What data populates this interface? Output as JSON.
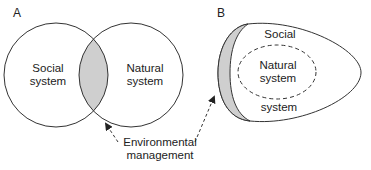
{
  "panels": {
    "a": {
      "letter": "A",
      "left_circle_label_line1": "Social",
      "left_circle_label_line2": "system",
      "right_circle_label_line1": "Natural",
      "right_circle_label_line2": "system"
    },
    "b": {
      "letter": "B",
      "outer_label_top": "Social",
      "outer_label_bottom": "system",
      "inner_label_line1": "Natural",
      "inner_label_line2": "system"
    }
  },
  "callout": {
    "line1": "Environmental",
    "line2": "management"
  },
  "colors": {
    "stroke": "#333333",
    "overlap_fill": "#cfcfcf",
    "background": "#ffffff"
  }
}
